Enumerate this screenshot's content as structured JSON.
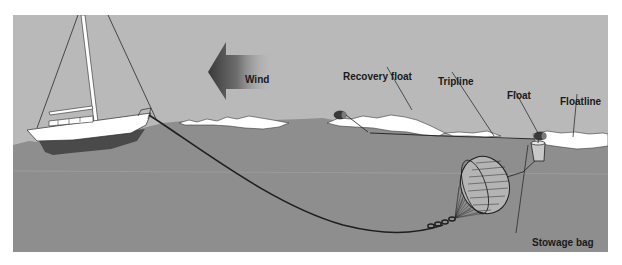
{
  "diagram": {
    "labels": {
      "wind": "Wind",
      "recovery_float": "Recovery float",
      "tripline": "Tripline",
      "float": "Float",
      "floatline": "Floatline",
      "stowage_bag": "Stowage bag"
    },
    "colors": {
      "sky": "#b9b9b9",
      "sea": "#8e8e8e",
      "foam": "#ffffff",
      "hull_bottom": "#4a4a4a",
      "line": "#1e1e1e",
      "wind_arrow": "#5a5a5a"
    }
  }
}
